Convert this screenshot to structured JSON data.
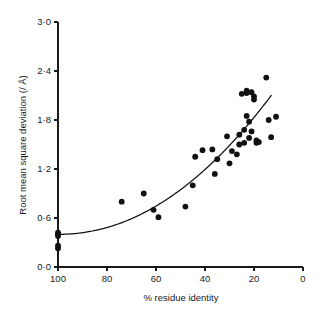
{
  "chart_data": {
    "type": "scatter",
    "title": "",
    "xlabel": "% residue identity",
    "ylabel": "Root mean square deviation (/ Å)",
    "xlim": [
      100,
      0
    ],
    "ylim": [
      0.0,
      3.0
    ],
    "x_reversed": true,
    "grid": false,
    "legend": null,
    "xticks": [
      100,
      80,
      60,
      40,
      20,
      0
    ],
    "xtick_labels": [
      "100",
      "80",
      "60",
      "40",
      "20",
      "0"
    ],
    "yticks": [
      0.0,
      0.6,
      1.2,
      1.8,
      2.4,
      3.0
    ],
    "ytick_labels": [
      "0·0",
      "0·6",
      "1·2",
      "1·8",
      "2·4",
      "3·0"
    ],
    "points": [
      {
        "x": 100,
        "y": 0.42
      },
      {
        "x": 100,
        "y": 0.4
      },
      {
        "x": 100,
        "y": 0.38
      },
      {
        "x": 100,
        "y": 0.26
      },
      {
        "x": 100,
        "y": 0.23
      },
      {
        "x": 74,
        "y": 0.8
      },
      {
        "x": 65,
        "y": 0.9
      },
      {
        "x": 61,
        "y": 0.7
      },
      {
        "x": 59,
        "y": 0.61
      },
      {
        "x": 48,
        "y": 0.74
      },
      {
        "x": 45,
        "y": 1.0
      },
      {
        "x": 44,
        "y": 1.35
      },
      {
        "x": 41,
        "y": 1.43
      },
      {
        "x": 37,
        "y": 1.44
      },
      {
        "x": 36,
        "y": 1.14
      },
      {
        "x": 35,
        "y": 1.32
      },
      {
        "x": 31,
        "y": 1.6
      },
      {
        "x": 30,
        "y": 1.27
      },
      {
        "x": 29,
        "y": 1.42
      },
      {
        "x": 27,
        "y": 1.38
      },
      {
        "x": 26,
        "y": 1.62
      },
      {
        "x": 26,
        "y": 1.5
      },
      {
        "x": 25,
        "y": 2.12
      },
      {
        "x": 24,
        "y": 1.52
      },
      {
        "x": 24,
        "y": 1.68
      },
      {
        "x": 23,
        "y": 2.13
      },
      {
        "x": 23,
        "y": 2.16
      },
      {
        "x": 23,
        "y": 1.85
      },
      {
        "x": 22,
        "y": 1.78
      },
      {
        "x": 22,
        "y": 1.58
      },
      {
        "x": 21,
        "y": 2.14
      },
      {
        "x": 21,
        "y": 1.66
      },
      {
        "x": 20,
        "y": 2.09
      },
      {
        "x": 20,
        "y": 2.05
      },
      {
        "x": 19,
        "y": 1.55
      },
      {
        "x": 19,
        "y": 1.52
      },
      {
        "x": 18,
        "y": 1.53
      },
      {
        "x": 15,
        "y": 2.32
      },
      {
        "x": 14,
        "y": 1.8
      },
      {
        "x": 13,
        "y": 1.59
      },
      {
        "x": 11,
        "y": 1.84
      }
    ],
    "fit_curve": {
      "description": "monotonic increasing fitted trend line",
      "x_start": 100,
      "x_end": 13,
      "y_start": 0.4,
      "y_end": 2.1
    }
  },
  "colors": {
    "point": "#111111",
    "curve": "#111111",
    "axis": "#1a1a1a",
    "background": "#ffffff"
  }
}
